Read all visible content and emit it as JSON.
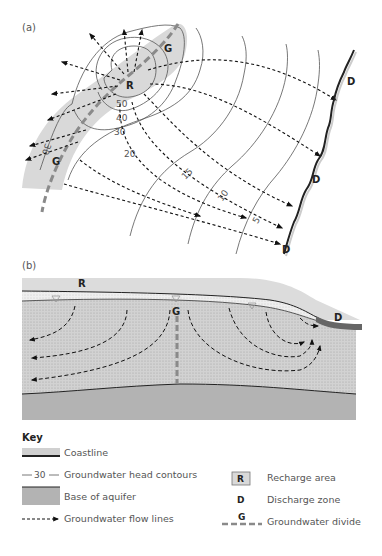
{
  "panel_a": {
    "label": "(a)",
    "recharge_label": "R",
    "divide_label": "G",
    "discharge_label": "D",
    "contours": [
      "50",
      "40",
      "30",
      "20",
      "15",
      "10",
      "5",
      "30"
    ]
  },
  "panel_b": {
    "label": "(b)",
    "recharge_label": "R",
    "divide_label": "G",
    "discharge_label": "D"
  },
  "key": {
    "title": "Key",
    "items": [
      {
        "symbol": "coastline-swatch",
        "label": "Coastline"
      },
      {
        "symbol": "contour-swatch",
        "symbol_text": "30",
        "label": "Groundwater head contours"
      },
      {
        "symbol": "aquifer-base-swatch",
        "label": "Base of aquifer"
      },
      {
        "symbol": "flow-line-swatch",
        "label": "Groundwater flow lines"
      },
      {
        "symbol": "recharge-swatch",
        "symbol_text": "R",
        "label": "Recharge area"
      },
      {
        "symbol": "discharge-swatch",
        "symbol_text": "D",
        "label": "Discharge zone"
      },
      {
        "symbol": "divide-swatch",
        "symbol_text": "G",
        "label": "Groundwater divide"
      }
    ]
  },
  "colors": {
    "recharge_fill": "#d9d9d9",
    "aquifer_fill": "#cfcfcf",
    "base_fill": "#b3b3b3",
    "divide_line": "#8a8a8a",
    "line": "#222222"
  }
}
